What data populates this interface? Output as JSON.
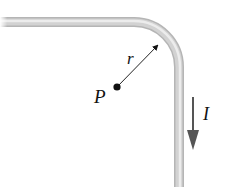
{
  "diagram": {
    "type": "physics-magnetic-field",
    "labels": {
      "radius": "r",
      "point": "P",
      "current": "I"
    },
    "colors": {
      "wire_light": "#e6e6e6",
      "wire_mid": "#c4c4c4",
      "wire_dark": "#a8a8a8",
      "arrow": "#555555",
      "point": "#111111",
      "radius_line": "#222222"
    },
    "geometry": {
      "wire_horizontal_y": 22,
      "wire_vertical_x": 179,
      "corner_radius": 45,
      "point_P": [
        117,
        87
      ],
      "radius_arrow_tip": [
        160,
        43
      ],
      "current_arrow": {
        "x": 193,
        "y_start": 97,
        "y_end": 150
      }
    }
  }
}
